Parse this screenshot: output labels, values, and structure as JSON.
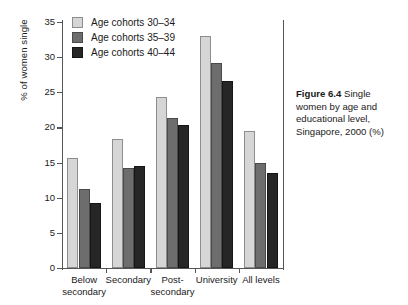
{
  "chart_data": {
    "type": "bar",
    "title": "",
    "xlabel": "",
    "ylabel": "% of women single",
    "ylim": [
      0,
      35
    ],
    "yticks": [
      0,
      5,
      10,
      15,
      20,
      25,
      30,
      35
    ],
    "grid": false,
    "legend_position": "top-left",
    "categories": [
      "Below secondary",
      "Secondary",
      "Post-secondary",
      "University",
      "All levels"
    ],
    "category_lines": [
      [
        "Below",
        "secondary"
      ],
      [
        "Secondary"
      ],
      [
        "Post-",
        "secondary"
      ],
      [
        "University"
      ],
      [
        "All levels"
      ]
    ],
    "series": [
      {
        "name": "Age cohorts 30–34",
        "color": "#d6d6d6",
        "values": [
          15.6,
          18.4,
          24.4,
          33.0,
          19.5
        ]
      },
      {
        "name": "Age cohorts 35–39",
        "color": "#6d6d6d",
        "values": [
          11.3,
          14.3,
          21.3,
          29.2,
          14.9
        ]
      },
      {
        "name": "Age cohorts 40–44",
        "color": "#262626",
        "values": [
          9.2,
          14.5,
          20.4,
          26.6,
          13.5
        ]
      }
    ]
  },
  "legend": {
    "items": [
      {
        "label": "Age cohorts 30–34"
      },
      {
        "label": "Age cohorts 35–39"
      },
      {
        "label": "Age cohorts 40–44"
      }
    ]
  },
  "caption": {
    "label": "Figure 6.4",
    "text": " Single women by age and educational level, Singapore, 2000 (%)"
  }
}
